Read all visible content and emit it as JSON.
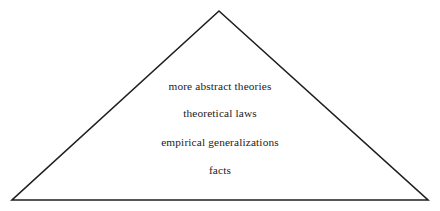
{
  "diagram": {
    "type": "pyramid",
    "shape_name": "triangle-outline",
    "background_color": "#ffffff",
    "stroke_color": "#1f1f1f",
    "stroke_width": 1.6,
    "apex": {
      "x": 219,
      "y": 11
    },
    "base_left": {
      "x": 12,
      "y": 200
    },
    "base_right": {
      "x": 428,
      "y": 200
    },
    "layers": [
      {
        "label": "more abstract theories",
        "level": 1,
        "center_x": 219,
        "center_y": 86
      },
      {
        "label": "theoretical laws",
        "level": 2,
        "center_x": 219,
        "center_y": 113
      },
      {
        "label": "empirical generalizations",
        "level": 3,
        "center_x": 219,
        "center_y": 142
      },
      {
        "label": "facts",
        "level": 4,
        "center_x": 219,
        "center_y": 170
      }
    ]
  }
}
